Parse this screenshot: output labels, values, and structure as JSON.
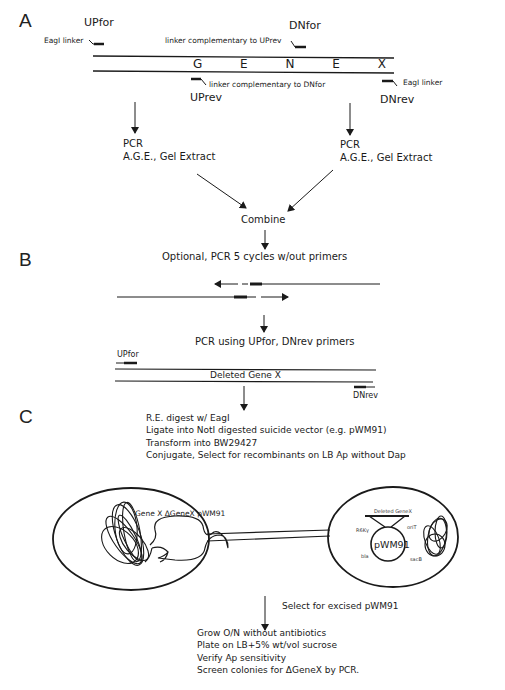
{
  "panels": {
    "A": {
      "label": "A",
      "primers": {
        "upfor": "UPfor",
        "dnfor": "DNfor",
        "uprev": "UPrev",
        "dnrev": "DNrev"
      },
      "linkers": {
        "eagi_left": "EagI linker",
        "comp_uprev": "linker complementary to UPrev",
        "comp_dnfor": "linker complementary to DNfor",
        "eagi_right": "EagI linker"
      },
      "gene_label": "G E N E X",
      "left_step": [
        "PCR",
        "A.G.E., Gel Extract"
      ],
      "right_step": [
        "PCR",
        "A.G.E., Gel Extract"
      ],
      "combine": "Combine"
    },
    "B": {
      "label": "B",
      "optional_step": "Optional, PCR 5 cycles w/out primers",
      "pcr_step": "PCR using UPfor, DNrev primers",
      "primers": {
        "upfor": "UPfor",
        "dnrev": "DNrev"
      },
      "product_label": "Deleted Gene X"
    },
    "C": {
      "label": "C",
      "steps": [
        "R.E. digest w/ EagI",
        "Ligate into NotI digested suicide vector (e.g. pWM91)",
        "Transform into BW29427",
        "Conjugate, Select for recombinants on LB Ap without Dap"
      ],
      "donor_cell_label": "Gene X  ΔGeneX pWM91",
      "plasmid": {
        "name": "pWM91",
        "insert": "Deleted GeneX",
        "features": {
          "top_left": "R6Kγ",
          "top_right": "oriT",
          "bottom_left": "bla",
          "bottom_right": "sacB"
        }
      },
      "select_step": "Select for excised pWM91",
      "final_steps": [
        "Grow O/N without antibiotics",
        "Plate on LB+5% wt/vol sucrose",
        "Verify Ap sensitivity",
        "Screen colonies for ΔGeneX by PCR."
      ]
    }
  },
  "colors": {
    "ink": "#1a1a1a",
    "background": "#ffffff"
  }
}
